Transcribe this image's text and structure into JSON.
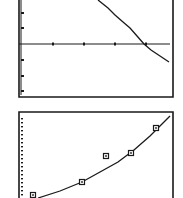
{
  "colors": {
    "ink": "#1a1a1a",
    "background": "#ffffff"
  },
  "chart_data": [
    {
      "type": "line",
      "title": "",
      "xlabel": "",
      "ylabel": "",
      "description": "Decreasing curve (exponential decay style) crossing the horizontal x-axis",
      "grid": false,
      "axis": {
        "x_axis_pixel_y": 44,
        "x_ticks_px": [
          53,
          84,
          115,
          146
        ],
        "y_ticks_px": [
          13,
          28,
          60,
          76,
          91
        ]
      },
      "curve_px": [
        [
          98,
          0
        ],
        [
          108,
          8
        ],
        [
          115,
          15
        ],
        [
          123,
          22
        ],
        [
          130,
          28
        ],
        [
          137,
          36
        ],
        [
          144,
          44
        ],
        [
          151,
          50
        ],
        [
          157,
          54
        ],
        [
          163,
          58
        ],
        [
          169,
          62
        ]
      ],
      "frame_px": {
        "left": 19,
        "right": 173,
        "bottom": 97
      }
    },
    {
      "type": "scatter",
      "title": "",
      "xlabel": "",
      "ylabel": "",
      "description": "Scatter points (square markers) with an increasing fitted curve",
      "grid": false,
      "points_px": [
        [
          33,
          195
        ],
        [
          82,
          182
        ],
        [
          106,
          156
        ],
        [
          131,
          153
        ],
        [
          156,
          128
        ]
      ],
      "fit_curve_px": [
        [
          38,
          198
        ],
        [
          60,
          191
        ],
        [
          82,
          182
        ],
        [
          100,
          172
        ],
        [
          118,
          162
        ],
        [
          134,
          150
        ],
        [
          150,
          136
        ],
        [
          162,
          124
        ],
        [
          170,
          116
        ]
      ],
      "frame_px": {
        "left": 19,
        "right": 173,
        "top": 112
      },
      "y_ticks_dense": true
    }
  ]
}
